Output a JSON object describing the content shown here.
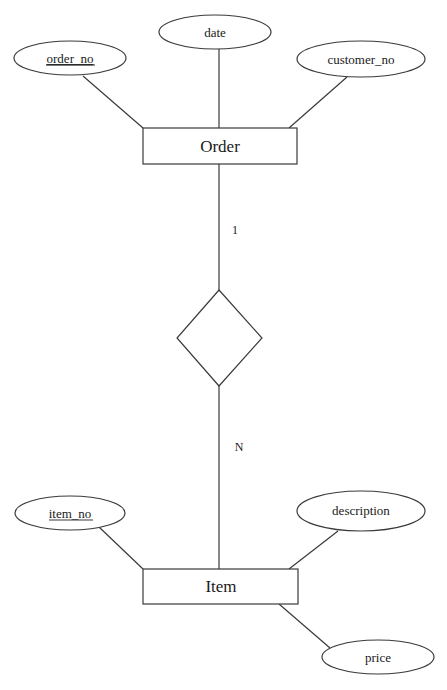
{
  "diagram": {
    "type": "er-diagram",
    "entities": [
      {
        "name": "Order",
        "x": 143,
        "y": 128,
        "w": 154,
        "h": 36
      },
      {
        "name": "Item",
        "x": 143,
        "y": 569,
        "w": 155,
        "h": 35
      }
    ],
    "relationship": {
      "name": "",
      "cx": 219,
      "cy": 338,
      "hw": 43,
      "hh": 48
    },
    "cardinalities": [
      {
        "label": "1",
        "x": 235,
        "y": 234
      },
      {
        "label": "N",
        "x": 239,
        "y": 451
      }
    ],
    "attributes": [
      {
        "name": "order_no",
        "entity": "Order",
        "key": true,
        "cx": 70,
        "cy": 58
      },
      {
        "name": "date",
        "entity": "Order",
        "key": false,
        "cx": 215,
        "cy": 32
      },
      {
        "name": "customer_no",
        "entity": "Order",
        "key": false,
        "cx": 361,
        "cy": 59
      },
      {
        "name": "item_no",
        "entity": "Item",
        "key": true,
        "cx": 70,
        "cy": 513
      },
      {
        "name": "description",
        "entity": "Item",
        "key": false,
        "cx": 361,
        "cy": 511
      },
      {
        "name": "price",
        "entity": "Item",
        "key": false,
        "cx": 378,
        "cy": 657
      }
    ],
    "relations": [
      {
        "from": "Order",
        "to": "Item",
        "cardinality_from": "1",
        "cardinality_to": "N"
      }
    ]
  },
  "labels": {
    "order_no": "order_no",
    "date": "date",
    "customer_no": "customer_no",
    "order": "Order",
    "one": "1",
    "many": "N",
    "item_no": "item_no",
    "description": "description",
    "item": "Item",
    "price": "price"
  }
}
